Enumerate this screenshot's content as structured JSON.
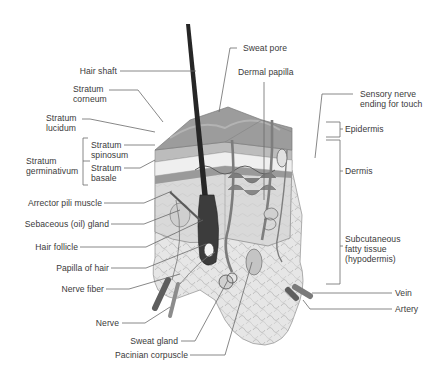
{
  "diagram": {
    "colors": {
      "background": "#ffffff",
      "label_text": "#3a3a3a",
      "leader_line": "#6a6a6a",
      "epidermis_top": "#8a8a8a",
      "dermis": "#d6d6d6",
      "subcutaneous_fat": "#e4e4e4",
      "hair_shaft": "#262626",
      "vessel": "#707070"
    },
    "labels_left": [
      {
        "id": "hair-shaft",
        "text": "Hair shaft"
      },
      {
        "id": "stratum-corneum",
        "text": "Stratum\ncorneum"
      },
      {
        "id": "stratum-lucidum",
        "text": "Stratum\nlucidum"
      },
      {
        "id": "stratum-spinosum",
        "text": "Stratum\nspinosum"
      },
      {
        "id": "stratum-basale",
        "text": "Stratum\nbasale"
      },
      {
        "id": "stratum-germinativum",
        "text": "Stratum\ngerminativum"
      },
      {
        "id": "arrector-pili-muscle",
        "text": "Arrector pili muscle"
      },
      {
        "id": "sebaceous-gland",
        "text": "Sebaceous (oil) gland"
      },
      {
        "id": "hair-follicle",
        "text": "Hair follicle"
      },
      {
        "id": "papilla-of-hair",
        "text": "Papilla of hair"
      },
      {
        "id": "nerve-fiber",
        "text": "Nerve fiber"
      },
      {
        "id": "nerve",
        "text": "Nerve"
      },
      {
        "id": "sweat-gland",
        "text": "Sweat gland"
      },
      {
        "id": "pacinian-corpuscle",
        "text": "Pacinian corpuscle"
      }
    ],
    "labels_right": [
      {
        "id": "sweat-pore",
        "text": "Sweat pore"
      },
      {
        "id": "dermal-papilla",
        "text": "Dermal papilla"
      },
      {
        "id": "sensory-nerve-ending",
        "text": "Sensory nerve\nending for touch"
      },
      {
        "id": "epidermis",
        "text": "Epidermis"
      },
      {
        "id": "dermis",
        "text": "Dermis"
      },
      {
        "id": "subcutaneous-tissue",
        "text": "Subcutaneous\nfatty tissue\n(hypodermis)"
      },
      {
        "id": "vein",
        "text": "Vein"
      },
      {
        "id": "artery",
        "text": "Artery"
      }
    ]
  }
}
